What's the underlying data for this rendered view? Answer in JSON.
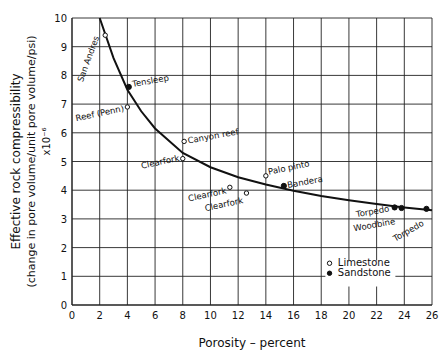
{
  "chart_data": {
    "type": "scatter",
    "title": "",
    "xlabel": "Porosity - percent",
    "ylabel_lines": [
      "Effective rock compressibility",
      "(change in pore volume/unit pore volume/psi)",
      "x10^-6"
    ],
    "xlim": [
      0,
      26
    ],
    "ylim": [
      0,
      10
    ],
    "xticks": [
      0,
      2,
      4,
      6,
      8,
      10,
      12,
      14,
      16,
      18,
      20,
      22,
      24,
      26
    ],
    "yticks": [
      0,
      1,
      2,
      3,
      4,
      5,
      6,
      7,
      8,
      9,
      10
    ],
    "grid": true,
    "legend": {
      "position": "lower right",
      "entries": [
        {
          "label": "Limestone",
          "marker": "open-circle"
        },
        {
          "label": "Sandstone",
          "marker": "filled-circle"
        }
      ]
    },
    "series": [
      {
        "name": "Limestone",
        "marker": "open-circle",
        "points": [
          {
            "label": "San Andres",
            "x": 2.4,
            "y": 9.4
          },
          {
            "label": "Reef (Penn)",
            "x": 4.0,
            "y": 6.9
          },
          {
            "label": "Canyon reef",
            "x": 8.1,
            "y": 5.7
          },
          {
            "label": "Clearfork",
            "x": 8.0,
            "y": 5.1
          },
          {
            "label": "Palo pinto",
            "x": 14.0,
            "y": 4.5
          },
          {
            "label": "Clearfork",
            "x": 11.4,
            "y": 4.1
          },
          {
            "label": "Clearfork",
            "x": 12.6,
            "y": 3.9
          }
        ]
      },
      {
        "name": "Sandstone",
        "marker": "filled-circle",
        "points": [
          {
            "label": "Tensleep",
            "x": 4.1,
            "y": 7.6
          },
          {
            "label": "Bandera",
            "x": 15.3,
            "y": 4.15
          },
          {
            "label": "Torpedo",
            "x": 23.3,
            "y": 3.4
          },
          {
            "label": "Woodbine",
            "x": 23.8,
            "y": 3.38
          },
          {
            "label": "Torpedo",
            "x": 25.6,
            "y": 3.35
          }
        ]
      },
      {
        "name": "Fitted curve",
        "type": "line",
        "x": [
          2.0,
          3,
          4,
          5,
          6,
          8,
          10,
          12,
          14,
          16,
          18,
          20,
          22,
          24,
          26
        ],
        "values": [
          10.0,
          8.6,
          7.5,
          6.75,
          6.15,
          5.3,
          4.8,
          4.45,
          4.2,
          3.98,
          3.8,
          3.65,
          3.52,
          3.4,
          3.3
        ]
      }
    ]
  }
}
